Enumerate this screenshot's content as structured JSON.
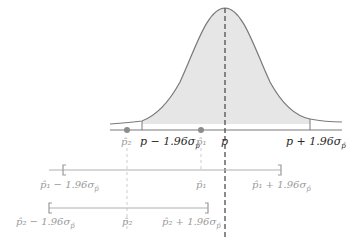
{
  "diagram": {
    "title": "",
    "colors": {
      "curve": "#7a7a7a",
      "fill": "#e6e6e6",
      "axis": "#7a7a7a",
      "dashed_p": "#5a5a5a",
      "dot": "#8c8c8c",
      "interval": "#b0b0b0"
    },
    "axis_labels": {
      "p2_hat": "p̂₂",
      "p_minus": "p − 1.96σ",
      "p_minus_sub": "p̂",
      "p1_hat": "p̂₁",
      "p": "p",
      "p_plus": "p + 1.96σ",
      "p_plus_sub": "p̂"
    },
    "interval_1": {
      "left_label": "p̂₁ − 1.96σ",
      "left_sub": "p̂",
      "center_label": "p̂₁",
      "right_label": "p̂₁ + 1.96σ",
      "right_sub": "p̂"
    },
    "interval_2": {
      "left_label": "p̂₂ − 1.96σ",
      "left_sub": "p̂",
      "center_label": "p̂₂",
      "right_label": "p̂₂ + 1.96σ",
      "right_sub": "p̂"
    }
  }
}
